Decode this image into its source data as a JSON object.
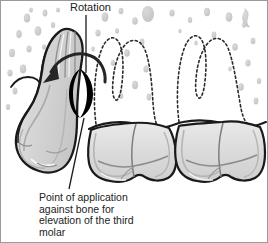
{
  "figure": {
    "background_color": "#ffffff",
    "border_color": "#9a9a9a",
    "width": 268,
    "height": 243
  },
  "labels": {
    "rotation": "Rotation",
    "caption_line1": "Point of application",
    "caption_line2": "against bone for",
    "caption_line3": "elevation of the third",
    "caption_line4": "molar"
  },
  "colors": {
    "outline": "#1a1a1a",
    "tooth_fill": "#d8d8d8",
    "tooth_highlight": "#efefef",
    "instrument_fill": "#d4d4d4",
    "instrument_highlight": "#ededed",
    "blade_black": "#000000",
    "stipple": "#c9c9c9",
    "stipple_light": "#dcdcdc",
    "dashed_root": "#2a2a2a",
    "leader_line": "#1a1a1a",
    "text": "#222222"
  },
  "anatomy": {
    "instrument_name": "dental elevator",
    "instrument_description": "elevator blade engaged at point of application on bone",
    "rotation_arrow": "curved arrow indicating rotational movement, counterclockwise toward the left",
    "fulcrum": "black crescent marking elevator blade contact point",
    "teeth": [
      {
        "name": "first-molar-crown",
        "position": "center",
        "roots_shown": "dashed outline, two roots with three cusp-root contours"
      },
      {
        "name": "second-molar-crown",
        "position": "right",
        "roots_shown": "dashed outline, two roots with three cusp-root contours"
      }
    ],
    "bone_crest": "horizontal undulating alveolar bone crest line across the mid-figure",
    "stippling": "gray teardrop stipple texture representing cancellous bone"
  }
}
